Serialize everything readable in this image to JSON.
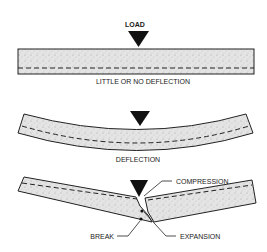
{
  "diagram": {
    "title_label": "LOAD",
    "panels": [
      {
        "id": "no-deflection",
        "caption": "LITTLE OR NO DEFLECTION"
      },
      {
        "id": "deflection",
        "caption": "DEFLECTION"
      },
      {
        "id": "break",
        "callouts": {
          "compression": "COMPRESSION",
          "expansion": "EXPANSION",
          "break": "BREAK"
        }
      }
    ]
  },
  "colors": {
    "slab_fill": "#dcdcdc",
    "outline": "#222222",
    "load_arrow": "#111111"
  }
}
